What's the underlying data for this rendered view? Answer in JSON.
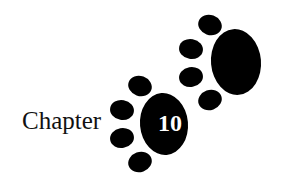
{
  "heading": {
    "word": "Chapter",
    "number": "10"
  },
  "decoration": {
    "motif": "paw-prints",
    "count": 2
  },
  "colors": {
    "ink": "#000000",
    "background": "#ffffff",
    "number_text": "#ffffff"
  }
}
